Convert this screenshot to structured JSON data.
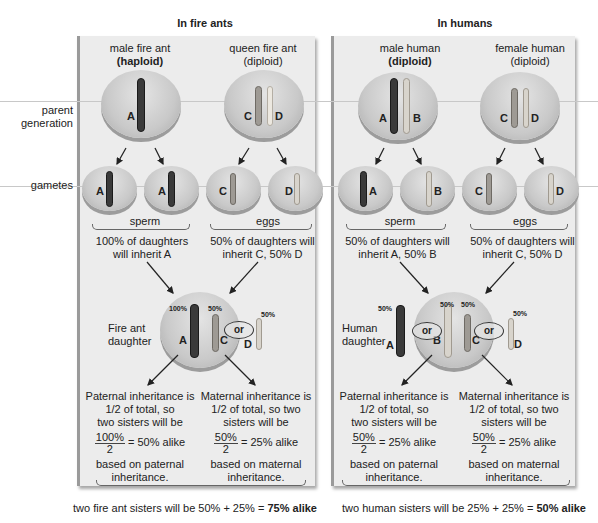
{
  "sections": {
    "ants": {
      "title": "In fire ants"
    },
    "humans": {
      "title": "In humans"
    }
  },
  "row_labels": {
    "parent": "parent\ngeneration",
    "parent_l1": "parent",
    "parent_l2": "generation",
    "gametes": "gametes"
  },
  "ants": {
    "male": {
      "line1": "male fire ant",
      "line2": "(haploid)",
      "chromosomes": [
        "A"
      ]
    },
    "female": {
      "line1": "queen fire ant",
      "line2": "(diploid)",
      "chromosomes": [
        "C",
        "D"
      ]
    },
    "gametes": [
      "A",
      "A",
      "C",
      "D"
    ],
    "sperm_label": "sperm",
    "eggs_label": "eggs",
    "sperm_note_l1": "100% of daughters",
    "sperm_note_l2": "will inherit A",
    "eggs_note_l1": "50% of daughters will",
    "eggs_note_l2": "inherit C, 50% D",
    "daughter": {
      "label_l1": "Fire ant",
      "label_l2": "daughter",
      "pct_A": "100%",
      "pct_C": "50%",
      "pct_D": "50%",
      "or": "or",
      "A": "A",
      "C": "C",
      "D": "D"
    },
    "paternal": {
      "l1": "Paternal inheritance is",
      "l2": "1/2 of total, so",
      "l3": "two sisters will be",
      "num": "100%",
      "den": "2",
      "eq": "= 50% alike",
      "l4": "based on paternal",
      "l5": "inheritance."
    },
    "maternal": {
      "l1": "Maternal inheritance is",
      "l2": "1/2 of total, so two",
      "l3": "sisters will be",
      "num": "50%",
      "den": "2",
      "eq": "= 25% alike",
      "l4": "based on maternal",
      "l5": "inheritance."
    },
    "summary": {
      "pre": "two fire ant sisters will be 50% + 25% = ",
      "bold": "75% alike"
    }
  },
  "humans": {
    "male": {
      "line1": "male human",
      "line2": "(diploid)",
      "chromosomes": [
        "A",
        "B"
      ]
    },
    "female": {
      "line1": "female human",
      "line2": "(diploid)",
      "chromosomes": [
        "C",
        "D"
      ]
    },
    "gametes": [
      "A",
      "B",
      "C",
      "D"
    ],
    "sperm_label": "sperm",
    "eggs_label": "eggs",
    "sperm_note_l1": "50% of daughters will",
    "sperm_note_l2": "inherit A, 50% B",
    "eggs_note_l1": "50% of daughters will",
    "eggs_note_l2": "inherit C, 50% D",
    "daughter": {
      "label_l1": "Human",
      "label_l2": "daughter",
      "pct_A": "50%",
      "pct_B": "50%",
      "pct_C": "50%",
      "pct_D": "50%",
      "or": "or",
      "A": "A",
      "B": "B",
      "C": "C",
      "D": "D"
    },
    "paternal": {
      "l1": "Paternal inheritance is",
      "l2": "1/2 of total, so",
      "l3": "two sisters will be",
      "num": "50%",
      "den": "2",
      "eq": "= 25% alike",
      "l4": "based on paternal",
      "l5": "inheritance."
    },
    "maternal": {
      "l1": "Maternal inheritance is",
      "l2": "1/2 of total, so two",
      "l3": "sisters will be",
      "num": "50%",
      "den": "2",
      "eq": "= 25% alike",
      "l4": "based on maternal",
      "l5": "inheritance."
    },
    "summary": {
      "pre": "two human sisters will be 25% + 25% = ",
      "bold": "50% alike"
    }
  }
}
